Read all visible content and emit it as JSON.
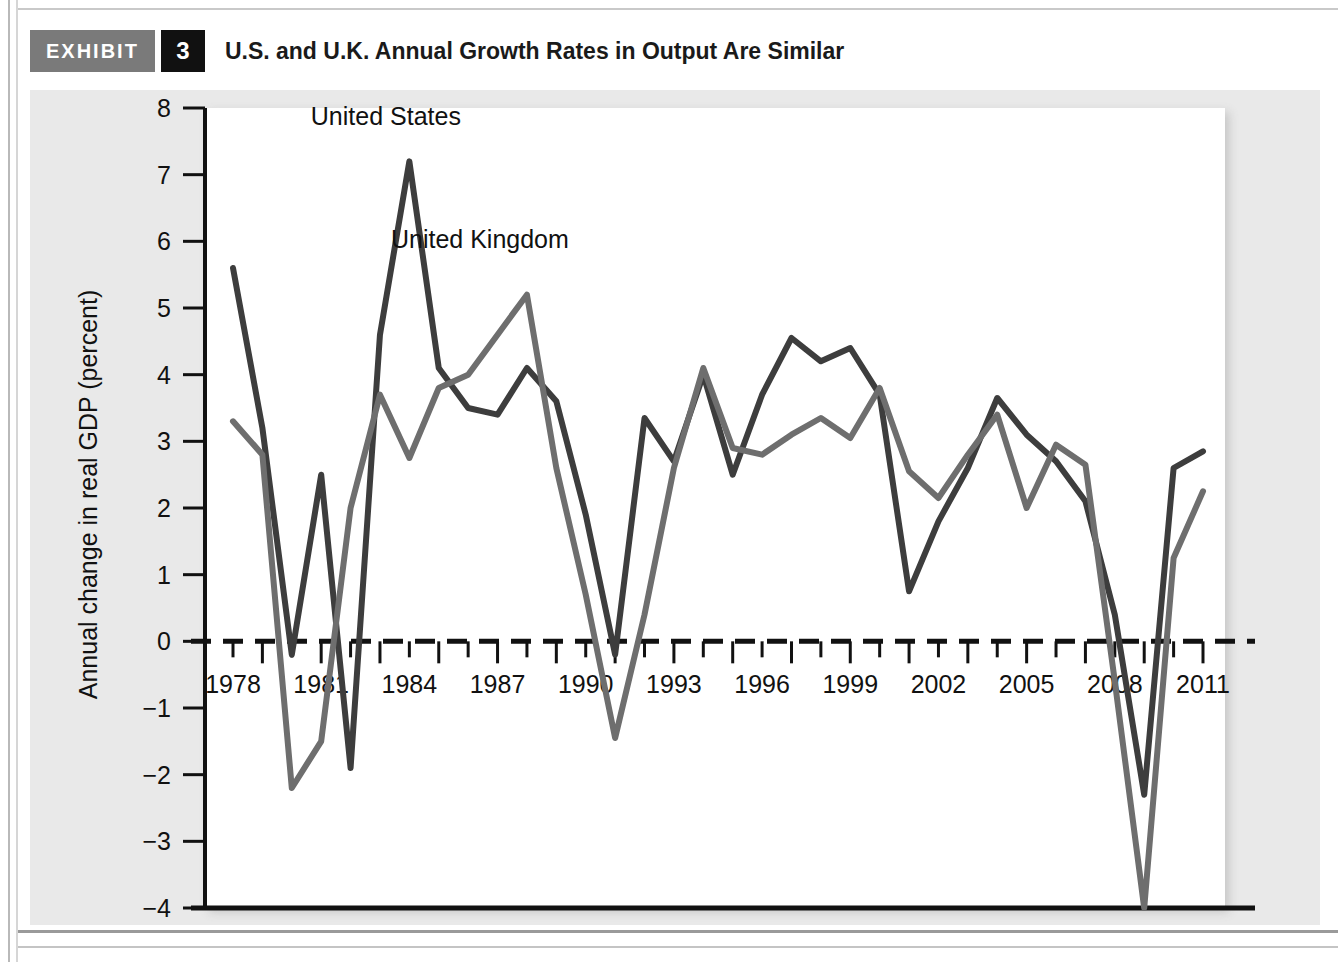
{
  "exhibit": {
    "tag_label": "EXHIBIT",
    "number": "3",
    "title": "U.S. and U.K. Annual Growth Rates in Output Are Similar"
  },
  "chart_data": {
    "type": "line",
    "title": "U.S. and U.K. Annual Growth Rates in Output Are Similar",
    "xlabel": "",
    "ylabel": "Annual change in real GDP (percent)",
    "xlim": [
      1978,
      2011
    ],
    "ylim": [
      -4,
      8
    ],
    "yticks": [
      8,
      7,
      6,
      5,
      4,
      3,
      2,
      1,
      0,
      -1,
      -2,
      -3,
      -4
    ],
    "ytick_labels": [
      "8",
      "7",
      "6",
      "5",
      "4",
      "3",
      "2",
      "1",
      "0",
      "−1",
      "−2",
      "−3",
      "−4"
    ],
    "xticks": [
      1978,
      1979,
      1980,
      1981,
      1982,
      1983,
      1984,
      1985,
      1986,
      1987,
      1988,
      1989,
      1990,
      1991,
      1992,
      1993,
      1994,
      1995,
      1996,
      1997,
      1998,
      1999,
      2000,
      2001,
      2002,
      2003,
      2004,
      2005,
      2006,
      2007,
      2008,
      2009,
      2010,
      2011
    ],
    "xtick_labels_shown": [
      "1978",
      "1981",
      "1984",
      "1987",
      "1990",
      "1993",
      "1996",
      "1999",
      "2002",
      "2005",
      "2008",
      "2011"
    ],
    "x": [
      1978,
      1979,
      1980,
      1981,
      1982,
      1983,
      1984,
      1985,
      1986,
      1987,
      1988,
      1989,
      1990,
      1991,
      1992,
      1993,
      1994,
      1995,
      1996,
      1997,
      1998,
      1999,
      2000,
      2001,
      2002,
      2003,
      2004,
      2005,
      2006,
      2007,
      2008,
      2009,
      2010,
      2011
    ],
    "grid": false,
    "zero_line": true,
    "legend_position": "inline-annotation",
    "series": [
      {
        "name": "United States",
        "color": "#3d3d3d",
        "label_x": 1983.2,
        "label_y": 7.75,
        "values": [
          5.6,
          3.2,
          -0.2,
          2.5,
          -1.9,
          4.6,
          7.2,
          4.1,
          3.5,
          3.4,
          4.1,
          3.6,
          1.9,
          -0.2,
          3.35,
          2.7,
          4.0,
          2.5,
          3.7,
          4.55,
          4.2,
          4.4,
          3.7,
          0.75,
          1.8,
          2.6,
          3.65,
          3.1,
          2.7,
          2.1,
          0.4,
          -2.3,
          2.6,
          2.85
        ]
      },
      {
        "name": "United Kingdom",
        "color": "#6e6e6e",
        "label_x": 1986.4,
        "label_y": 5.9,
        "values": [
          3.3,
          2.8,
          -2.2,
          -1.5,
          2.0,
          3.7,
          2.75,
          3.8,
          4.0,
          4.6,
          5.2,
          2.6,
          0.7,
          -1.45,
          0.4,
          2.6,
          4.1,
          2.9,
          2.8,
          3.1,
          3.35,
          3.05,
          3.8,
          2.55,
          2.15,
          2.8,
          3.4,
          2.0,
          2.95,
          2.65,
          -0.6,
          -4.0,
          1.25,
          2.25
        ]
      }
    ]
  }
}
